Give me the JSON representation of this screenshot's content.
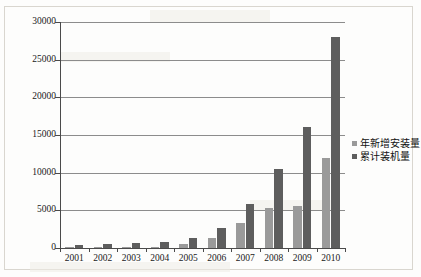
{
  "chart_data": {
    "type": "bar",
    "title": "",
    "xlabel": "",
    "ylabel": "",
    "ylim": [
      0,
      30000
    ],
    "ytick_labels": [
      "30000",
      "25000",
      "20000",
      "15000",
      "10000",
      "5000",
      "0"
    ],
    "ytick_values": [
      30000,
      25000,
      20000,
      15000,
      10000,
      5000,
      0
    ],
    "grid": true,
    "legend_position": "right",
    "categories": [
      "2001",
      "2002",
      "2003",
      "2004",
      "2005",
      "2006",
      "2007",
      "2008",
      "2009",
      "2010"
    ],
    "series": [
      {
        "name": "年新增安装量",
        "color": "#9a9a9a",
        "values": [
          100,
          150,
          100,
          200,
          500,
          1300,
          3300,
          5300,
          5600,
          12000
        ]
      },
      {
        "name": "累计装机量",
        "color": "#5e5e5e",
        "values": [
          400,
          500,
          600,
          760,
          1270,
          2600,
          5900,
          10500,
          16000,
          28000
        ]
      }
    ]
  },
  "legend": {
    "items": [
      {
        "label": "年新增安装量"
      },
      {
        "label": "累计装机量"
      }
    ]
  },
  "colors": {
    "series_new_installation": "#9a9a9a",
    "series_cumulative": "#5e5e5e",
    "gridline": "#8c8c8c",
    "axis": "#4a4a4a",
    "background": "#fdfdfc"
  }
}
